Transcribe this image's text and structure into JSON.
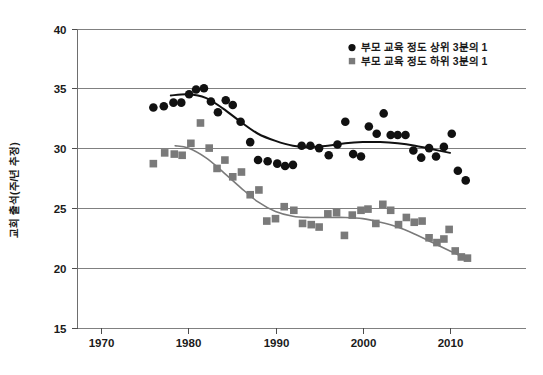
{
  "chart_data": {
    "type": "scatter",
    "title": "",
    "subtitle": "",
    "xlabel": "",
    "ylabel": "교회 출석(주/년 추정)",
    "xlim": [
      1968,
      2014.5
    ],
    "ylim": [
      15,
      40
    ],
    "xticks": [
      1970,
      1980,
      1990,
      2000,
      2010
    ],
    "yticks": [
      15,
      20,
      25,
      30,
      35,
      40
    ],
    "xtick_labels": [
      "1970",
      "1980",
      "1990",
      "2000",
      "2010"
    ],
    "ytick_labels": [
      "15",
      "20",
      "25",
      "30",
      "35",
      "40"
    ],
    "grid": "horizontal",
    "legend_position": "top-right",
    "series": [
      {
        "name": "부모 교육 정도 상위 3분의 1",
        "marker": "circle",
        "color": "#111111",
        "trend_color": "#111111",
        "points": [
          [
            1976.0,
            33.4
          ],
          [
            1977.2,
            33.5
          ],
          [
            1978.3,
            33.8
          ],
          [
            1979.2,
            33.8
          ],
          [
            1980.1,
            34.5
          ],
          [
            1980.9,
            34.9
          ],
          [
            1981.8,
            35.0
          ],
          [
            1982.6,
            33.9
          ],
          [
            1983.4,
            33.0
          ],
          [
            1984.3,
            34.0
          ],
          [
            1985.1,
            33.6
          ],
          [
            1986.0,
            32.2
          ],
          [
            1987.1,
            30.5
          ],
          [
            1988.0,
            29.0
          ],
          [
            1989.1,
            28.9
          ],
          [
            1990.2,
            28.7
          ],
          [
            1991.1,
            28.5
          ],
          [
            1992.0,
            28.6
          ],
          [
            1993.0,
            30.2
          ],
          [
            1994.0,
            30.2
          ],
          [
            1995.0,
            30.0
          ],
          [
            1996.1,
            29.4
          ],
          [
            1997.1,
            30.3
          ],
          [
            1998.0,
            32.2
          ],
          [
            1998.9,
            29.5
          ],
          [
            1999.8,
            29.3
          ],
          [
            2000.7,
            31.8
          ],
          [
            2001.6,
            31.2
          ],
          [
            2002.4,
            32.9
          ],
          [
            2003.2,
            31.1
          ],
          [
            2004.0,
            31.1
          ],
          [
            2004.9,
            31.1
          ],
          [
            2005.8,
            29.8
          ],
          [
            2006.7,
            29.2
          ],
          [
            2007.6,
            30.0
          ],
          [
            2008.4,
            29.3
          ],
          [
            2009.3,
            30.1
          ],
          [
            2010.2,
            31.2
          ],
          [
            2010.9,
            28.1
          ],
          [
            2011.8,
            27.3
          ]
        ],
        "trend": [
          [
            1978.0,
            34.4
          ],
          [
            1980.0,
            34.5
          ],
          [
            1982.0,
            34.2
          ],
          [
            1984.0,
            33.3
          ],
          [
            1986.0,
            32.2
          ],
          [
            1988.0,
            31.2
          ],
          [
            1990.0,
            30.6
          ],
          [
            1992.0,
            30.2
          ],
          [
            1994.0,
            30.1
          ],
          [
            1996.0,
            30.2
          ],
          [
            1998.0,
            30.4
          ],
          [
            2000.0,
            30.5
          ],
          [
            2002.0,
            30.5
          ],
          [
            2004.0,
            30.4
          ],
          [
            2006.0,
            30.2
          ],
          [
            2008.0,
            29.9
          ],
          [
            2010.0,
            29.6
          ]
        ]
      },
      {
        "name": "부모 교육 정도 하위 3분의 1",
        "marker": "square",
        "color": "#7a7a7a",
        "trend_color": "#7a7a7a",
        "points": [
          [
            1976.0,
            28.7
          ],
          [
            1977.3,
            29.6
          ],
          [
            1978.4,
            29.5
          ],
          [
            1979.3,
            29.4
          ],
          [
            1980.3,
            30.4
          ],
          [
            1981.4,
            32.1
          ],
          [
            1982.4,
            30.0
          ],
          [
            1983.3,
            28.3
          ],
          [
            1984.2,
            29.0
          ],
          [
            1985.1,
            27.6
          ],
          [
            1986.1,
            28.0
          ],
          [
            1987.1,
            26.1
          ],
          [
            1988.1,
            26.5
          ],
          [
            1989.0,
            23.9
          ],
          [
            1990.0,
            24.1
          ],
          [
            1991.0,
            25.1
          ],
          [
            1992.1,
            24.8
          ],
          [
            1993.1,
            23.7
          ],
          [
            1994.1,
            23.6
          ],
          [
            1995.0,
            23.4
          ],
          [
            1996.0,
            24.5
          ],
          [
            1997.0,
            24.6
          ],
          [
            1997.9,
            22.7
          ],
          [
            1998.8,
            24.4
          ],
          [
            1999.8,
            24.8
          ],
          [
            2000.6,
            24.9
          ],
          [
            2001.5,
            23.7
          ],
          [
            2002.3,
            25.3
          ],
          [
            2003.2,
            24.8
          ],
          [
            2004.1,
            23.6
          ],
          [
            2005.0,
            24.2
          ],
          [
            2005.9,
            23.8
          ],
          [
            2006.8,
            23.9
          ],
          [
            2007.6,
            22.5
          ],
          [
            2008.5,
            22.1
          ],
          [
            2009.3,
            22.4
          ],
          [
            2009.9,
            23.2
          ],
          [
            2010.6,
            21.4
          ],
          [
            2011.3,
            20.9
          ],
          [
            2012.0,
            20.8
          ]
        ],
        "trend": [
          [
            1978.5,
            30.2
          ],
          [
            1980.0,
            30.0
          ],
          [
            1982.0,
            29.2
          ],
          [
            1984.0,
            28.0
          ],
          [
            1986.0,
            26.7
          ],
          [
            1988.0,
            25.5
          ],
          [
            1990.0,
            24.7
          ],
          [
            1992.0,
            24.3
          ],
          [
            1994.0,
            24.2
          ],
          [
            1996.0,
            24.2
          ],
          [
            1998.0,
            24.2
          ],
          [
            2000.0,
            24.1
          ],
          [
            2002.0,
            23.8
          ],
          [
            2004.0,
            23.4
          ],
          [
            2006.0,
            22.8
          ],
          [
            2008.0,
            22.1
          ],
          [
            2010.0,
            21.4
          ],
          [
            2011.5,
            20.9
          ]
        ]
      }
    ]
  },
  "legend": {
    "entries": [
      {
        "label": "부모 교육 정도 상위 3분의 1",
        "marker": "circle",
        "color": "#111111"
      },
      {
        "label": "부모 교육 정도 하위 3분의 1",
        "marker": "square",
        "color": "#7a7a7a"
      }
    ]
  },
  "colors": {
    "high_education": "#111111",
    "low_education": "#7a7a7a",
    "gridline": "#808080",
    "background": "#ffffff"
  }
}
